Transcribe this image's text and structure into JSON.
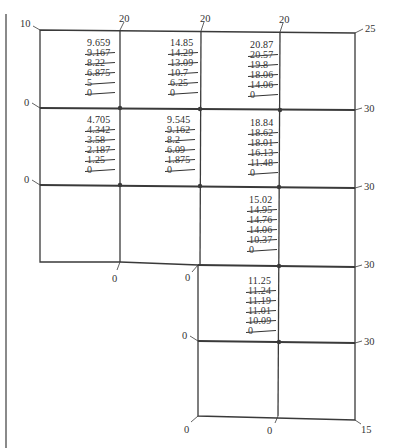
{
  "figure": {
    "boundary_labels": {
      "top": [
        {
          "id": "top-left-corner",
          "text": "10"
        },
        {
          "id": "top-1",
          "text": "20"
        },
        {
          "id": "top-2",
          "text": "20"
        },
        {
          "id": "top-3",
          "text": "20"
        },
        {
          "id": "top-right-corner",
          "text": "25"
        }
      ],
      "left": [
        {
          "id": "left-row1",
          "text": "0"
        },
        {
          "id": "left-row2",
          "text": "0"
        },
        {
          "id": "left-row4",
          "text": "0"
        }
      ],
      "right": [
        {
          "id": "right-row1",
          "text": "30"
        },
        {
          "id": "right-row2",
          "text": "30"
        },
        {
          "id": "right-row3",
          "text": "30"
        },
        {
          "id": "right-row4",
          "text": "30"
        }
      ],
      "bottom": [
        {
          "id": "bottom-step-1",
          "text": "0"
        },
        {
          "id": "bottom-step-2",
          "text": "0"
        },
        {
          "id": "bottom-final-left",
          "text": "0"
        },
        {
          "id": "bottom-final-mid",
          "text": "0"
        },
        {
          "id": "bottom-final-right",
          "text": "15"
        }
      ]
    },
    "nodes": [
      {
        "id": "node-1",
        "final": "9.659",
        "history": [
          "9.167",
          "8.22",
          "6.875",
          "5",
          "0"
        ]
      },
      {
        "id": "node-2",
        "final": "14.85",
        "history": [
          "14.29",
          "13.09",
          "10.7",
          "6.25",
          "0"
        ]
      },
      {
        "id": "node-3",
        "final": "20.87",
        "history": [
          "20.57",
          "19.8",
          "18.06",
          "14.06",
          "0"
        ]
      },
      {
        "id": "node-4",
        "final": "4.705",
        "history": [
          "4.342",
          "3.58",
          "2.187",
          "1.25",
          "0"
        ]
      },
      {
        "id": "node-5",
        "final": "9.545",
        "history": [
          "9.162",
          "8.2",
          "6.09",
          "1.875",
          "0"
        ]
      },
      {
        "id": "node-6",
        "final": "18.84",
        "history": [
          "18.62",
          "18.01",
          "16.13",
          "11.48",
          "0"
        ]
      },
      {
        "id": "node-7",
        "final": "15.02",
        "history": [
          "14.95",
          "14.76",
          "14.06",
          "10.37",
          "0"
        ]
      },
      {
        "id": "node-8",
        "final": "11.25",
        "history": [
          "11.24",
          "11.19",
          "11.01",
          "10.09",
          "0"
        ]
      }
    ]
  }
}
